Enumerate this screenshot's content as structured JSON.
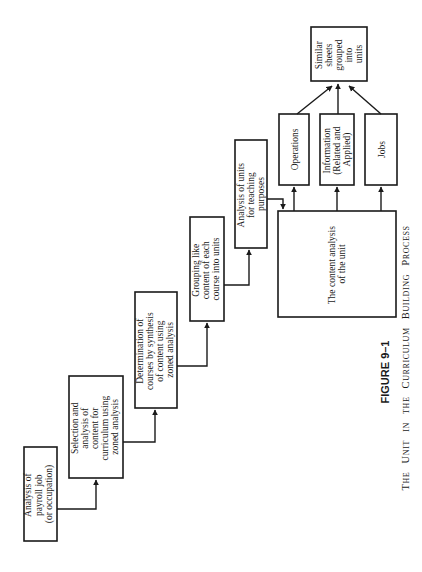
{
  "figure": {
    "number": "FIGURE 9–1",
    "caption_words": [
      {
        "first": "T",
        "rest": "HE"
      },
      {
        "first": "U",
        "rest": "NIT"
      },
      {
        "first": "",
        "rest": "IN"
      },
      {
        "first": "",
        "rest": "THE"
      },
      {
        "first": "C",
        "rest": "URRICULUM"
      },
      {
        "first": "B",
        "rest": "UILDING"
      },
      {
        "first": "P",
        "rest": "ROCESS"
      }
    ],
    "caption_full": "The Unit in the Curriculum Building Process"
  },
  "steps": [
    {
      "id": "step1",
      "lines": [
        "Analysis of",
        "payroll job",
        "(or occupation)"
      ]
    },
    {
      "id": "step2",
      "lines": [
        "Selection and",
        "analysis of",
        "content for",
        "curriculum using",
        "zoned analysis"
      ]
    },
    {
      "id": "step3",
      "lines": [
        "Determination of",
        "courses by synthesis",
        "of content using",
        "zoned analysis"
      ]
    },
    {
      "id": "step4",
      "lines": [
        "Grouping like",
        "content of each",
        "course into units"
      ]
    },
    {
      "id": "step5",
      "lines": [
        "Analysis of units",
        "for teaching",
        "purposes"
      ]
    }
  ],
  "content_analysis": {
    "lines": [
      "The content analysis",
      "of the unit"
    ]
  },
  "outputs": [
    {
      "id": "operations",
      "lines": [
        "Operations"
      ]
    },
    {
      "id": "information",
      "lines": [
        "Information",
        "(Related and",
        "Applied)"
      ]
    },
    {
      "id": "jobs",
      "lines": [
        "Jobs"
      ]
    }
  ],
  "result": {
    "lines": [
      "Similar",
      "sheets",
      "grouped",
      "into",
      "units"
    ]
  }
}
